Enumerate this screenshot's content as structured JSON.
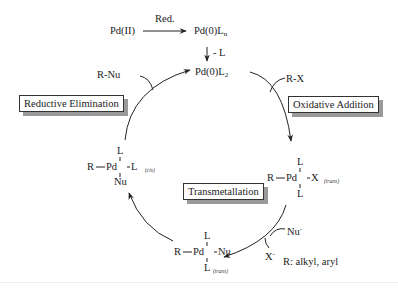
{
  "diagram": {
    "precatalyst": {
      "start": "Pd(II)",
      "reduction_label": "Red.",
      "product_base": "Pd(0)L",
      "product_sub": "n",
      "ligand_loss_label": "- L"
    },
    "active_catalyst": {
      "base": "Pd(0)L",
      "sub": "2"
    },
    "steps": [
      {
        "name": "Oxidative Addition",
        "reagent": "R-X"
      },
      {
        "name": "Transmetallation",
        "reagent_in": "Nu",
        "reagent_in_charge": "-",
        "reagent_out": "X",
        "reagent_out_charge": "-"
      },
      {
        "name": "Reductive Elimination",
        "product": "R-Nu"
      }
    ],
    "intermediates": {
      "oxidative_adduct": {
        "top": "L",
        "left": "R",
        "metal": "Pd",
        "right": "X",
        "bottom": "L",
        "geometry": "(trans)"
      },
      "transmetallated_trans": {
        "top": "L",
        "left": "R",
        "metal": "Pd",
        "right": "Nu",
        "bottom": "L",
        "geometry": "(trans)"
      },
      "transmetallated_cis": {
        "top": "L",
        "left": "R",
        "metal": "Pd",
        "right": "L",
        "bottom": "Nu",
        "geometry": "(cis)"
      }
    },
    "legend": "R: alkyl, aryl"
  },
  "colors": {
    "ink": "#222222",
    "shadow": "#9a9a9a",
    "background": "#ffffff"
  }
}
